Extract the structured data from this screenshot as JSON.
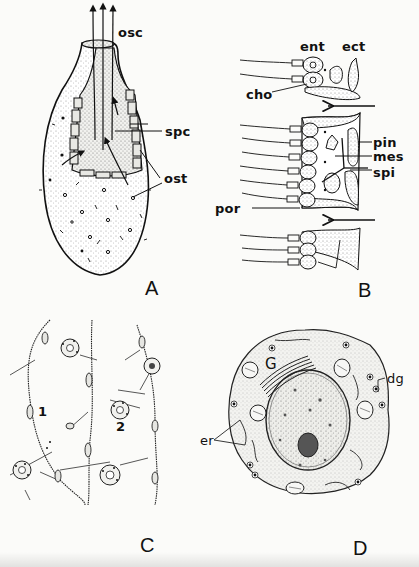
{
  "figure": {
    "panels": [
      {
        "id": "A",
        "letter": "A",
        "labels": {
          "osc": "osc",
          "spc": "spc",
          "ost": "ost"
        }
      },
      {
        "id": "B",
        "letter": "B",
        "labels": {
          "ent": "ent",
          "ect": "ect",
          "cho": "cho",
          "pin": "pin",
          "mes": "mes",
          "spi": "spi",
          "por": "por"
        }
      },
      {
        "id": "C",
        "letter": "C",
        "labels": {
          "one": "1",
          "two": "2"
        }
      },
      {
        "id": "D",
        "letter": "D",
        "labels": {
          "G": "G",
          "dg": "dg",
          "er": "er"
        }
      }
    ]
  },
  "colors": {
    "ink": "#111111",
    "paper": "#fbfbf9",
    "stipple": "#bdbdb8"
  }
}
